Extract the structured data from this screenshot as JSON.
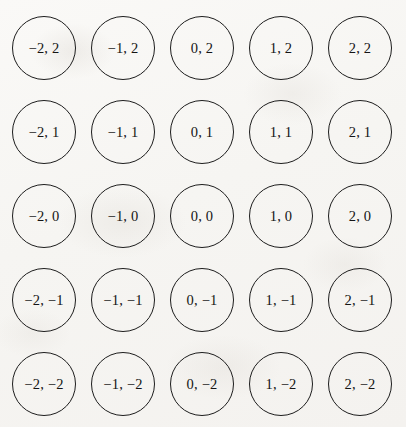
{
  "figure": {
    "type": "node-grid",
    "rows": 5,
    "columns": 5,
    "background_color": "#f8f7f5",
    "stroke_color": "#1d1d1d",
    "text_color": "#141414",
    "node_diameter_px": 64,
    "column_pitch_px": 79,
    "row_pitch_px": 84,
    "origin_x_px": 12,
    "origin_y_px": 16
  },
  "chart_data": {
    "type": "scatter",
    "title": "",
    "xlabel": "",
    "ylabel": "",
    "xlim": [
      -2,
      2
    ],
    "ylim": [
      -2,
      2
    ],
    "x_ticks": [
      -2,
      -1,
      0,
      1,
      2
    ],
    "y_ticks": [
      2,
      1,
      0,
      -1,
      -2
    ],
    "grid": false,
    "legend": "none",
    "points": [
      {
        "x": -2,
        "y": 2
      },
      {
        "x": -1,
        "y": 2
      },
      {
        "x": 0,
        "y": 2
      },
      {
        "x": 1,
        "y": 2
      },
      {
        "x": 2,
        "y": 2
      },
      {
        "x": -2,
        "y": 1
      },
      {
        "x": -1,
        "y": 1
      },
      {
        "x": 0,
        "y": 1
      },
      {
        "x": 1,
        "y": 1
      },
      {
        "x": 2,
        "y": 1
      },
      {
        "x": -2,
        "y": 0
      },
      {
        "x": -1,
        "y": 0
      },
      {
        "x": 0,
        "y": 0
      },
      {
        "x": 1,
        "y": 0
      },
      {
        "x": 2,
        "y": 0
      },
      {
        "x": -2,
        "y": -1
      },
      {
        "x": -1,
        "y": -1
      },
      {
        "x": 0,
        "y": -1
      },
      {
        "x": 1,
        "y": -1
      },
      {
        "x": 2,
        "y": -1
      },
      {
        "x": -2,
        "y": -2
      },
      {
        "x": -1,
        "y": -2
      },
      {
        "x": 0,
        "y": -2
      },
      {
        "x": 1,
        "y": -2
      },
      {
        "x": 2,
        "y": -2
      }
    ]
  },
  "nodes": [
    {
      "label": "−2, 2",
      "row": 0,
      "col": 0
    },
    {
      "label": "−1, 2",
      "row": 0,
      "col": 1
    },
    {
      "label": "0, 2",
      "row": 0,
      "col": 2
    },
    {
      "label": "1, 2",
      "row": 0,
      "col": 3
    },
    {
      "label": "2, 2",
      "row": 0,
      "col": 4
    },
    {
      "label": "−2, 1",
      "row": 1,
      "col": 0
    },
    {
      "label": "−1, 1",
      "row": 1,
      "col": 1
    },
    {
      "label": "0, 1",
      "row": 1,
      "col": 2
    },
    {
      "label": "1, 1",
      "row": 1,
      "col": 3
    },
    {
      "label": "2, 1",
      "row": 1,
      "col": 4
    },
    {
      "label": "−2, 0",
      "row": 2,
      "col": 0
    },
    {
      "label": "−1, 0",
      "row": 2,
      "col": 1
    },
    {
      "label": "0, 0",
      "row": 2,
      "col": 2
    },
    {
      "label": "1, 0",
      "row": 2,
      "col": 3
    },
    {
      "label": "2, 0",
      "row": 2,
      "col": 4
    },
    {
      "label": "−2, −1",
      "row": 3,
      "col": 0
    },
    {
      "label": "−1, −1",
      "row": 3,
      "col": 1
    },
    {
      "label": "0, −1",
      "row": 3,
      "col": 2
    },
    {
      "label": "1, −1",
      "row": 3,
      "col": 3
    },
    {
      "label": "2, −1",
      "row": 3,
      "col": 4
    },
    {
      "label": "−2, −2",
      "row": 4,
      "col": 0
    },
    {
      "label": "−1, −2",
      "row": 4,
      "col": 1
    },
    {
      "label": "0, −2",
      "row": 4,
      "col": 2
    },
    {
      "label": "1, −2",
      "row": 4,
      "col": 3
    },
    {
      "label": "2, −2",
      "row": 4,
      "col": 4
    }
  ]
}
